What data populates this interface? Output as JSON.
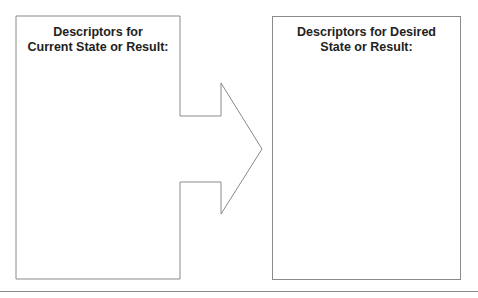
{
  "diagram": {
    "left_box": {
      "title_line1": "Descriptors for",
      "title_line2": "Current State or Result:"
    },
    "right_box": {
      "title_line1": "Descriptors for Desired",
      "title_line2": "State or Result:"
    },
    "arrow": {
      "direction": "right"
    },
    "colors": {
      "stroke": "#8a8a8a",
      "text": "#222222",
      "background": "#ffffff"
    }
  }
}
